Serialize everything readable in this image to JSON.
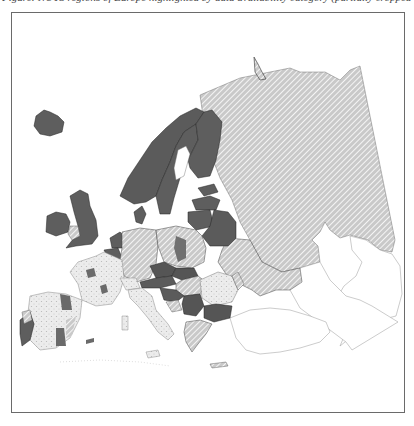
{
  "caption": {
    "text": "Figure: NUTS regions of Europe highlighted by data availability category (partially cropped caption)"
  },
  "map": {
    "title": "Map of Europe",
    "legend_categories": [
      {
        "key": "dark",
        "label": "National level data",
        "color": "#5a5a5a"
      },
      {
        "key": "hatched",
        "label": "Partial / estimated data",
        "color": "#9a9a9a"
      },
      {
        "key": "regional",
        "label": "Regional (NUTS) level data",
        "color": "#e6e6e6"
      },
      {
        "key": "none",
        "label": "No data",
        "color": "#ffffff"
      }
    ],
    "regions": [
      {
        "name": "Iceland",
        "category": "dark"
      },
      {
        "name": "Ireland",
        "category": "dark"
      },
      {
        "name": "United Kingdom",
        "category": "dark"
      },
      {
        "name": "Wales",
        "category": "hatched"
      },
      {
        "name": "Norway",
        "category": "dark"
      },
      {
        "name": "Sweden",
        "category": "dark"
      },
      {
        "name": "Finland",
        "category": "dark"
      },
      {
        "name": "Russia",
        "category": "hatched"
      },
      {
        "name": "Novaya Zemlya",
        "category": "hatched"
      },
      {
        "name": "Estonia",
        "category": "dark"
      },
      {
        "name": "Latvia",
        "category": "dark"
      },
      {
        "name": "Lithuania",
        "category": "dark"
      },
      {
        "name": "Belarus",
        "category": "dark"
      },
      {
        "name": "Ukraine",
        "category": "hatched"
      },
      {
        "name": "Denmark",
        "category": "dark"
      },
      {
        "name": "Netherlands",
        "category": "dark"
      },
      {
        "name": "Belgium",
        "category": "dark"
      },
      {
        "name": "Germany",
        "category": "hatched"
      },
      {
        "name": "Poland",
        "category": "hatched"
      },
      {
        "name": "Czechia",
        "category": "dark"
      },
      {
        "name": "Slovakia",
        "category": "dark"
      },
      {
        "name": "Austria",
        "category": "dark"
      },
      {
        "name": "Hungary",
        "category": "hatched"
      },
      {
        "name": "Romania",
        "category": "regional"
      },
      {
        "name": "Moldova",
        "category": "hatched"
      },
      {
        "name": "Bulgaria",
        "category": "dark"
      },
      {
        "name": "Serbia",
        "category": "dark"
      },
      {
        "name": "Croatia",
        "category": "dark"
      },
      {
        "name": "Bosnia",
        "category": "hatched"
      },
      {
        "name": "Greece",
        "category": "hatched"
      },
      {
        "name": "Italy",
        "category": "regional"
      },
      {
        "name": "France",
        "category": "regional"
      },
      {
        "name": "Spain",
        "category": "regional"
      },
      {
        "name": "Portugal",
        "category": "dark"
      },
      {
        "name": "Switzerland",
        "category": "regional"
      },
      {
        "name": "Turkey",
        "category": "none"
      },
      {
        "name": "Caucasus",
        "category": "none"
      },
      {
        "name": "Kazakhstan (partial)",
        "category": "none"
      }
    ]
  }
}
